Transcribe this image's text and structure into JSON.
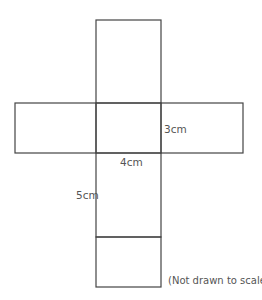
{
  "diagram": {
    "type": "cuboid-net",
    "line_color": "#444444",
    "labels": {
      "height": "3cm",
      "width": "4cm",
      "length": "5cm"
    },
    "note": "(Not drawn to scale)",
    "faces": [
      {
        "name": "top-flap",
        "x": 96,
        "y": 20,
        "w": 65,
        "h": 83
      },
      {
        "name": "left-side",
        "x": 15,
        "y": 103,
        "w": 81,
        "h": 50
      },
      {
        "name": "center-face",
        "x": 96,
        "y": 103,
        "w": 65,
        "h": 50
      },
      {
        "name": "right-side",
        "x": 161,
        "y": 103,
        "w": 82,
        "h": 50
      },
      {
        "name": "bottom-long-face",
        "x": 96,
        "y": 153,
        "w": 65,
        "h": 84
      },
      {
        "name": "bottom-end-face",
        "x": 96,
        "y": 237,
        "w": 65,
        "h": 50
      }
    ]
  }
}
